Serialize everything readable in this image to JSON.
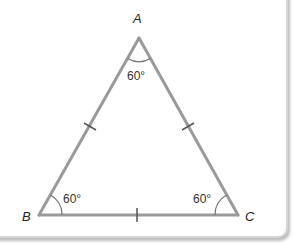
{
  "diagram": {
    "vertices": [
      {
        "name": "A",
        "label": "A",
        "angle": "60°"
      },
      {
        "name": "B",
        "label": "B",
        "angle": "60°"
      },
      {
        "name": "C",
        "label": "C",
        "angle": "60°"
      }
    ],
    "sides": [
      "AB",
      "AC",
      "BC"
    ],
    "equal_side_marks": 3,
    "colors": {
      "line": "#9a9a9a",
      "tick": "#555555",
      "text": "#222222",
      "border": "#d6d6d6"
    }
  }
}
